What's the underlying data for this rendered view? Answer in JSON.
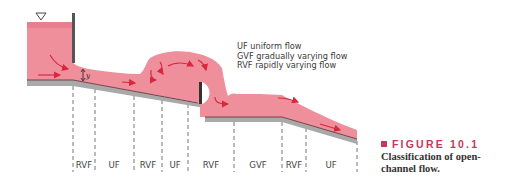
{
  "figure": {
    "label": "FIGURE 10.1",
    "caption_line1": "Classification of open-",
    "caption_line2": "channel flow.",
    "accent_color": "#c8375a"
  },
  "legend": {
    "items": [
      {
        "abbr": "UF",
        "text": "UF uniform flow"
      },
      {
        "abbr": "GVF",
        "text": "GVF gradually varying flow"
      },
      {
        "abbr": "RVF",
        "text": "RVF rapidly varying flow"
      }
    ]
  },
  "diagram": {
    "depth_symbol": "y",
    "free_surface_symbol": "triangle",
    "water_color": "#ef8f9c",
    "bed_color": "#a9a9a9",
    "regions": [
      {
        "label": "RVF",
        "x": 84
      },
      {
        "label": "UF",
        "x": 114
      },
      {
        "label": "RVF",
        "x": 148
      },
      {
        "label": "UF",
        "x": 175
      },
      {
        "label": "RVF",
        "x": 211
      },
      {
        "label": "GVF",
        "x": 258
      },
      {
        "label": "RVF",
        "x": 294
      },
      {
        "label": "UF",
        "x": 331
      }
    ],
    "dividers_x": [
      73,
      95,
      134,
      162,
      188,
      234,
      282,
      306,
      357
    ]
  }
}
